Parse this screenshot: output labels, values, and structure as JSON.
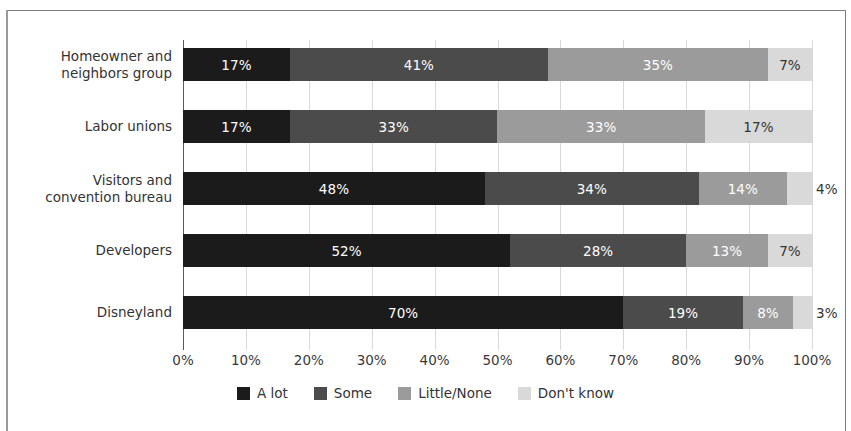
{
  "chart_data": {
    "type": "bar",
    "orientation": "horizontal",
    "stacked": true,
    "normalized": "percent",
    "title": "",
    "xlabel": "",
    "ylabel": "",
    "xlim": [
      0,
      100
    ],
    "grid": true,
    "legend_position": "bottom",
    "categories": [
      "Homeowner and neighbors group",
      "Labor unions",
      "Visitors and convention bureau",
      "Developers",
      "Disneyland"
    ],
    "category_lines": [
      [
        "Homeowner and",
        "neighbors group"
      ],
      [
        "Labor unions"
      ],
      [
        "Visitors and",
        "convention bureau"
      ],
      [
        "Developers"
      ],
      [
        "Disneyland"
      ]
    ],
    "series": [
      {
        "name": "A lot",
        "color": "#1b1b1b",
        "values": [
          17,
          17,
          48,
          52,
          70
        ]
      },
      {
        "name": "Some",
        "color": "#4b4b4b",
        "values": [
          41,
          33,
          34,
          28,
          19
        ]
      },
      {
        "name": "Little/None",
        "color": "#9b9b9b",
        "values": [
          35,
          33,
          14,
          13,
          8
        ]
      },
      {
        "name": "Don't know",
        "color": "#d9d9d9",
        "values": [
          7,
          17,
          4,
          7,
          3
        ]
      }
    ],
    "data_labels": [
      [
        "17%",
        "41%",
        "35%",
        "7%"
      ],
      [
        "17%",
        "33%",
        "33%",
        "17%"
      ],
      [
        "48%",
        "34%",
        "14%",
        "4%"
      ],
      [
        "52%",
        "28%",
        "13%",
        "7%"
      ],
      [
        "70%",
        "19%",
        "8%",
        "3%"
      ]
    ],
    "xticks": [
      0,
      10,
      20,
      30,
      40,
      50,
      60,
      70,
      80,
      90,
      100
    ],
    "xtick_labels": [
      "0%",
      "10%",
      "20%",
      "30%",
      "40%",
      "50%",
      "60%",
      "70%",
      "80%",
      "90%",
      "100%"
    ]
  },
  "legend": {
    "items": [
      {
        "label": "A lot"
      },
      {
        "label": "Some"
      },
      {
        "label": "Little/None"
      },
      {
        "label": "Don't know"
      }
    ]
  }
}
